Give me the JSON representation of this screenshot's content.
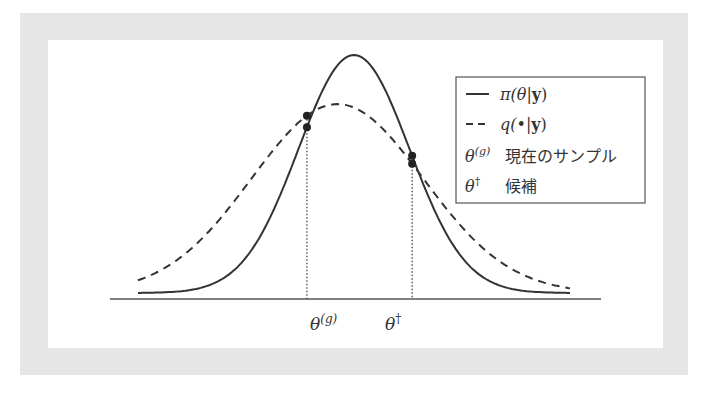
{
  "diagram": {
    "title": "",
    "colors": {
      "frame": "#e6e6e6",
      "curve": "#333333",
      "axis": "#555555"
    },
    "target_curve": {
      "name": "π(θ|y)",
      "style": "solid",
      "mean": 0.0,
      "sd": 1.0
    },
    "proposal_curve": {
      "name": "q(•|y)",
      "style": "dashed",
      "mean": -0.3,
      "sd": 1.55
    },
    "points": [
      {
        "id": "current",
        "x": -0.85,
        "label": "θ(g)"
      },
      {
        "id": "candidate",
        "x": 1.05,
        "label": "θ†"
      }
    ],
    "x_range": [
      -3.9,
      3.9
    ],
    "axis_labels": {
      "current": "θ",
      "current_sup": "(g)",
      "candidate": "θ",
      "candidate_sup": "†"
    },
    "legend": {
      "items": [
        {
          "symbol": "solid-line",
          "label": "π(θ|",
          "bold": "y",
          "tail": ")"
        },
        {
          "symbol": "dashed-line",
          "label": "q(•|",
          "bold": "y",
          "tail": ")"
        },
        {
          "symbol": "θ",
          "sup": "(g)",
          "label": "現在のサンプル"
        },
        {
          "symbol": "θ",
          "sup": "†",
          "label": "候補"
        }
      ]
    }
  }
}
